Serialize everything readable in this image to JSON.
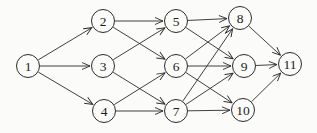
{
  "diagram": {
    "type": "directed-graph",
    "background_color": "#fbfbf9",
    "stroke_color": "#2b2b2b",
    "node_fill_color": "#fbfbf9",
    "node_radius": 11.5,
    "canvas": {
      "width": 317,
      "height": 133
    },
    "nodes": [
      {
        "id": "1",
        "label": "1",
        "x": 28,
        "y": 66
      },
      {
        "id": "2",
        "label": "2",
        "x": 103,
        "y": 21
      },
      {
        "id": "3",
        "label": "3",
        "x": 103,
        "y": 66
      },
      {
        "id": "4",
        "label": "4",
        "x": 104,
        "y": 111
      },
      {
        "id": "5",
        "label": "5",
        "x": 176,
        "y": 21
      },
      {
        "id": "6",
        "label": "6",
        "x": 176,
        "y": 66
      },
      {
        "id": "7",
        "label": "7",
        "x": 176,
        "y": 111
      },
      {
        "id": "8",
        "label": "8",
        "x": 240,
        "y": 18
      },
      {
        "id": "9",
        "label": "9",
        "x": 244,
        "y": 66
      },
      {
        "id": "10",
        "label": "10",
        "x": 243,
        "y": 110
      },
      {
        "id": "11",
        "label": "11",
        "x": 290,
        "y": 64
      }
    ],
    "edges": [
      {
        "from": "1",
        "to": "2"
      },
      {
        "from": "1",
        "to": "3"
      },
      {
        "from": "1",
        "to": "4"
      },
      {
        "from": "2",
        "to": "5"
      },
      {
        "from": "2",
        "to": "6"
      },
      {
        "from": "3",
        "to": "5"
      },
      {
        "from": "3",
        "to": "7"
      },
      {
        "from": "4",
        "to": "6"
      },
      {
        "from": "4",
        "to": "7"
      },
      {
        "from": "5",
        "to": "8"
      },
      {
        "from": "5",
        "to": "9"
      },
      {
        "from": "6",
        "to": "8"
      },
      {
        "from": "6",
        "to": "9"
      },
      {
        "from": "6",
        "to": "10"
      },
      {
        "from": "7",
        "to": "8"
      },
      {
        "from": "7",
        "to": "9"
      },
      {
        "from": "7",
        "to": "10"
      },
      {
        "from": "8",
        "to": "11"
      },
      {
        "from": "9",
        "to": "11"
      },
      {
        "from": "10",
        "to": "11"
      }
    ]
  }
}
